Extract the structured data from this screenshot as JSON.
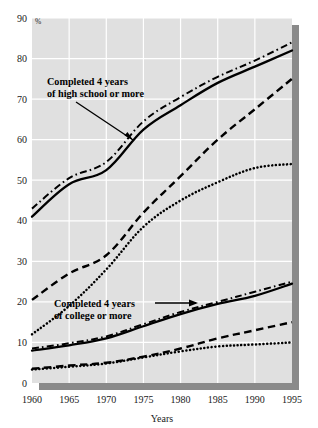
{
  "figure": {
    "percent_symbol": "%",
    "xlabel": "Years",
    "background_color": "#ffffff",
    "plot_background_color": "#e0e0e0",
    "gridline_color": "#ffffff",
    "shadow_color": "#8a8a8a",
    "line_color": "#000000"
  },
  "annotations": {
    "highschool": {
      "line1": "Completed 4 years",
      "line2": "of high school or more"
    },
    "college": {
      "line1": "Completed 4 years",
      "line2": "of college or more"
    }
  },
  "axis": {
    "y_ticks": [
      "0",
      "10",
      "20",
      "30",
      "40",
      "50",
      "60",
      "70",
      "80",
      "90"
    ],
    "x_ticks": [
      "1960",
      "1965",
      "1970",
      "1975",
      "1980",
      "1985",
      "1990",
      "1995"
    ]
  },
  "chart_data": {
    "type": "line",
    "title": "",
    "subtitle": "",
    "xlabel": "Years",
    "ylabel": "%",
    "xlim": [
      1960,
      1995
    ],
    "ylim": [
      0,
      90
    ],
    "grid": true,
    "legend_position": "annotations-inline",
    "x": [
      1960,
      1965,
      1970,
      1975,
      1980,
      1985,
      1990,
      1995
    ],
    "series": [
      {
        "name": "High school or more - dash-dot",
        "group": "Completed 4 years of high school or more",
        "style": "dashdot",
        "values": [
          43.0,
          50.5,
          54.5,
          64.5,
          70.5,
          75.5,
          79.5,
          84.0
        ]
      },
      {
        "name": "High school or more - solid",
        "group": "Completed 4 years of high school or more",
        "style": "solid",
        "values": [
          41.0,
          49.0,
          52.5,
          62.5,
          68.5,
          74.0,
          78.0,
          82.0
        ]
      },
      {
        "name": "High school or more - dashed",
        "group": "Completed 4 years of high school or more",
        "style": "dashed",
        "values": [
          20.5,
          27.0,
          31.5,
          42.0,
          51.0,
          60.0,
          67.5,
          75.0
        ]
      },
      {
        "name": "High school or more - dotted",
        "group": "Completed 4 years of high school or more",
        "style": "dotted",
        "values": [
          12.0,
          19.0,
          28.0,
          38.5,
          45.0,
          49.5,
          53.0,
          54.0
        ]
      },
      {
        "name": "College or more - dash-dot",
        "group": "Completed 4 years of college or more",
        "style": "dashdot",
        "values": [
          8.5,
          9.8,
          11.5,
          14.5,
          17.5,
          20.0,
          22.5,
          25.0
        ]
      },
      {
        "name": "College or more - solid",
        "group": "Completed 4 years of college or more",
        "style": "solid",
        "values": [
          8.0,
          9.3,
          11.0,
          14.0,
          17.0,
          19.5,
          21.5,
          24.5
        ]
      },
      {
        "name": "College or more - dashed",
        "group": "Completed 4 years of college or more",
        "style": "dashed",
        "values": [
          3.5,
          4.3,
          5.0,
          6.5,
          8.5,
          11.0,
          13.0,
          15.0
        ]
      },
      {
        "name": "College or more - dotted",
        "group": "Completed 4 years of college or more",
        "style": "dotted",
        "values": [
          3.3,
          4.0,
          4.8,
          6.3,
          7.8,
          9.0,
          9.5,
          10.0
        ]
      }
    ]
  }
}
